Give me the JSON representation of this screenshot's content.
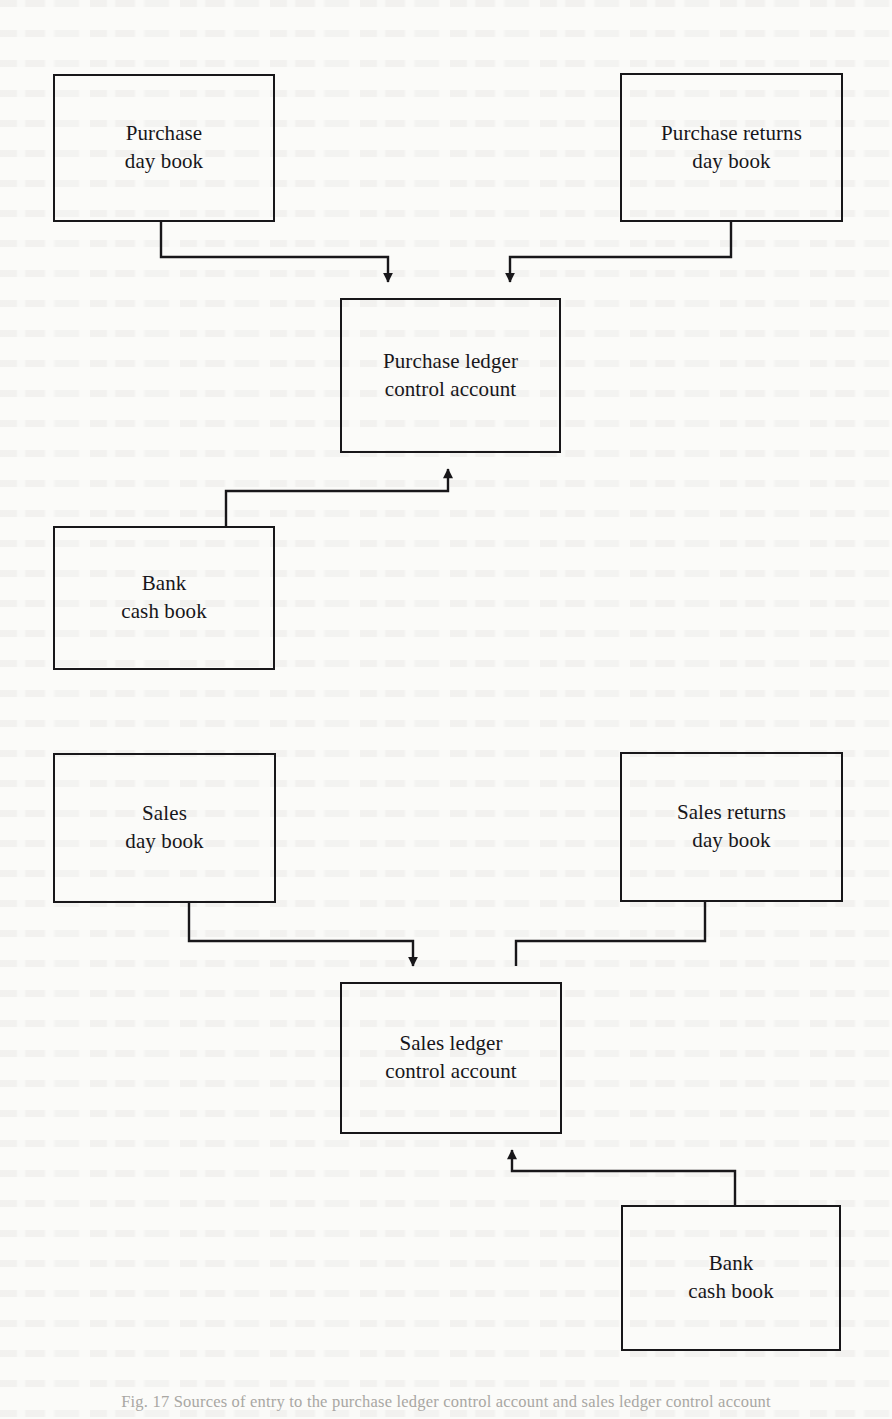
{
  "figure": {
    "caption": "Fig. 17 Sources of entry to the purchase ledger control account and sales ledger control account",
    "background_color": "#fbfbf9",
    "line_color": "#18171a"
  },
  "nodes": [
    {
      "id": "purchase-day-book",
      "label": "Purchase\nday book",
      "x": 53,
      "y": 74,
      "w": 222,
      "h": 148
    },
    {
      "id": "purchase-returns-day-book",
      "label": "Purchase returns\nday book",
      "x": 620,
      "y": 73,
      "w": 223,
      "h": 149
    },
    {
      "id": "purchase-ledger-control-account",
      "label": "Purchase ledger\ncontrol account",
      "x": 340,
      "y": 298,
      "w": 221,
      "h": 155
    },
    {
      "id": "bank-cash-book-upper",
      "label": "Bank\ncash book",
      "x": 53,
      "y": 526,
      "w": 222,
      "h": 144
    },
    {
      "id": "sales-day-book",
      "label": "Sales\nday book",
      "x": 53,
      "y": 753,
      "w": 223,
      "h": 150
    },
    {
      "id": "sales-returns-day-book",
      "label": "Sales returns\nday book",
      "x": 620,
      "y": 752,
      "w": 223,
      "h": 150
    },
    {
      "id": "sales-ledger-control-account",
      "label": "Sales ledger\ncontrol account",
      "x": 340,
      "y": 982,
      "w": 222,
      "h": 152
    },
    {
      "id": "bank-cash-book-lower",
      "label": "Bank\ncash book",
      "x": 621,
      "y": 1205,
      "w": 220,
      "h": 146
    }
  ],
  "connectors": [
    {
      "id": "purchase-day-book-to-purchase-ledger",
      "from": "purchase-day-book",
      "to": "purchase-ledger-control-account",
      "arrow": "down"
    },
    {
      "id": "purchase-returns-to-purchase-ledger",
      "from": "purchase-returns-day-book",
      "to": "purchase-ledger-control-account",
      "arrow": "down"
    },
    {
      "id": "bank-cash-book-to-purchase-ledger",
      "from": "bank-cash-book-upper",
      "to": "purchase-ledger-control-account",
      "arrow": "up"
    },
    {
      "id": "sales-day-book-to-sales-ledger",
      "from": "sales-day-book",
      "to": "sales-ledger-control-account",
      "arrow": "down"
    },
    {
      "id": "sales-returns-to-sales-ledger",
      "from": "sales-returns-day-book",
      "to": "sales-ledger-control-account",
      "arrow": "down"
    },
    {
      "id": "bank-cash-book-to-sales-ledger",
      "from": "bank-cash-book-lower",
      "to": "sales-ledger-control-account",
      "arrow": "up"
    }
  ]
}
